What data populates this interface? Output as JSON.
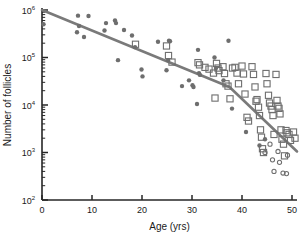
{
  "chart_data": {
    "type": "scatter",
    "title": "",
    "xlabel": "Age (yrs)",
    "ylabel": "Number of follicles",
    "xlim": [
      0,
      51
    ],
    "ylim": [
      100,
      1000000
    ],
    "yscale": "log",
    "xticks": [
      0,
      10,
      20,
      30,
      40,
      50
    ],
    "xtick_labels": [
      "0",
      "10",
      "20",
      "30",
      "40",
      "50"
    ],
    "yticks": [
      100,
      1000,
      10000,
      100000,
      1000000
    ],
    "ytick_labels": [
      "10",
      "10",
      "10",
      "10",
      "10"
    ],
    "ytick_exponents": [
      "2",
      "3",
      "4",
      "5",
      "6"
    ],
    "grid": false,
    "legend": "none",
    "marker_color": "#6e6e6e",
    "line_color": "#7a7a7a",
    "axis_color": "#262626",
    "series": [
      {
        "name": "filled-circles",
        "marker": "filled-circle",
        "points": [
          [
            0.3,
            500000
          ],
          [
            7.2,
            760000
          ],
          [
            7.4,
            460000
          ],
          [
            7.0,
            340000
          ],
          [
            8.4,
            270000
          ],
          [
            9.3,
            750000
          ],
          [
            12.5,
            370000
          ],
          [
            12.8,
            530000
          ],
          [
            14.6,
            600000
          ],
          [
            14.8,
            530000
          ],
          [
            15.2,
            88000
          ],
          [
            16.4,
            380000
          ],
          [
            18.0,
            290000
          ],
          [
            18.6,
            165000
          ],
          [
            19.9,
            56000
          ],
          [
            20.1,
            40000
          ],
          [
            23.2,
            215000
          ],
          [
            24.9,
            54000
          ],
          [
            25.4,
            225000
          ],
          [
            25.6,
            220000
          ],
          [
            25.2,
            88000
          ],
          [
            28.0,
            25000
          ],
          [
            29.4,
            33000
          ],
          [
            30.1,
            26000
          ],
          [
            30.3,
            24000
          ],
          [
            31.0,
            10500
          ],
          [
            31.2,
            145000
          ],
          [
            31.4,
            47000
          ],
          [
            31.6,
            43000
          ],
          [
            34.5,
            100000
          ],
          [
            34.8,
            60000
          ],
          [
            36.3,
            33000
          ],
          [
            37.3,
            225000
          ],
          [
            38.0,
            8400
          ],
          [
            40.8,
            2700
          ],
          [
            43.5,
            1400
          ],
          [
            44.6,
            1900
          ]
        ]
      },
      {
        "name": "open-squares",
        "marker": "open-square",
        "points": [
          [
            18.7,
            190000
          ],
          [
            24.9,
            175000
          ],
          [
            25.3,
            110000
          ],
          [
            26.0,
            80000
          ],
          [
            31.2,
            78000
          ],
          [
            31.5,
            70000
          ],
          [
            32.6,
            62000
          ],
          [
            33.4,
            57000
          ],
          [
            34.3,
            47000
          ],
          [
            34.6,
            14000
          ],
          [
            34.9,
            75000
          ],
          [
            35.2,
            60000
          ],
          [
            35.4,
            53000
          ],
          [
            36.2,
            64000
          ],
          [
            36.5,
            46000
          ],
          [
            36.8,
            28000
          ],
          [
            37.2,
            25000
          ],
          [
            37.6,
            13500
          ],
          [
            38.1,
            60000
          ],
          [
            38.6,
            62000
          ],
          [
            39.0,
            47000
          ],
          [
            39.3,
            28000
          ],
          [
            40.0,
            66000
          ],
          [
            40.3,
            45000
          ],
          [
            40.6,
            17000
          ],
          [
            41.0,
            5500
          ],
          [
            41.3,
            4600
          ],
          [
            42.0,
            64000
          ],
          [
            42.3,
            44000
          ],
          [
            42.6,
            24000
          ],
          [
            42.8,
            12000
          ],
          [
            43.0,
            13000
          ],
          [
            43.3,
            9000
          ],
          [
            43.5,
            6000
          ],
          [
            43.7,
            3000
          ],
          [
            43.9,
            2100
          ],
          [
            44.1,
            1200
          ],
          [
            44.3,
            1000
          ],
          [
            44.8,
            46000
          ],
          [
            45.0,
            28000
          ],
          [
            45.3,
            16000
          ],
          [
            45.5,
            11000
          ],
          [
            45.8,
            9500
          ],
          [
            46.0,
            8000
          ],
          [
            46.2,
            6000
          ],
          [
            46.4,
            2400
          ],
          [
            46.8,
            44000
          ],
          [
            47.0,
            12500
          ],
          [
            47.2,
            9500
          ],
          [
            47.4,
            8500
          ],
          [
            47.6,
            6500
          ],
          [
            47.8,
            3000
          ],
          [
            48.0,
            1900
          ],
          [
            48.3,
            1500
          ],
          [
            48.5,
            850
          ],
          [
            48.8,
            2900
          ],
          [
            49.0,
            2600
          ],
          [
            49.4,
            2400
          ],
          [
            49.7,
            1800
          ],
          [
            50.3,
            2700
          ],
          [
            50.6,
            2000
          ]
        ]
      },
      {
        "name": "open-circles",
        "marker": "open-circle",
        "points": [
          [
            44.6,
            1000
          ],
          [
            45.6,
            1500
          ],
          [
            46.1,
            700
          ],
          [
            46.4,
            400
          ],
          [
            47.2,
            1050
          ],
          [
            47.5,
            620
          ],
          [
            48.2,
            370
          ],
          [
            48.9,
            360
          ],
          [
            49.1,
            880
          ]
        ]
      }
    ],
    "fit_line": {
      "name": "bilinear-regression",
      "breakpoint_age": 37.5,
      "points": [
        [
          0,
          1000000
        ],
        [
          37.5,
          24000
        ],
        [
          51.0,
          1050
        ]
      ]
    }
  }
}
